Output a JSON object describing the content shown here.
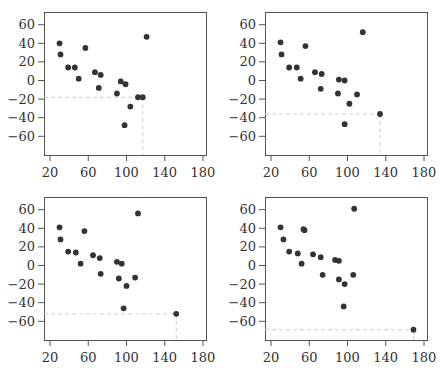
{
  "chart_data": [
    {
      "type": "scatter",
      "title": "",
      "xlabel": "",
      "ylabel": "",
      "xlim": [
        15,
        185
      ],
      "ylim": [
        -82,
        72
      ],
      "xticks": [
        20,
        60,
        100,
        140,
        180
      ],
      "yticks": [
        60,
        40,
        20,
        0,
        -20,
        -40,
        -60
      ],
      "xtick_labels": [
        "20",
        "60",
        "100",
        "140",
        "180"
      ],
      "ytick_labels": [
        "60",
        "40",
        "20",
        "0",
        "−20",
        "−40",
        "−60"
      ],
      "grid": false,
      "point_color": "#333333",
      "guide_color": "#cccccc",
      "highlight_point": {
        "x": 117,
        "y": -18
      },
      "points": [
        [
          30,
          40
        ],
        [
          31,
          28
        ],
        [
          39,
          14
        ],
        [
          46,
          14
        ],
        [
          50,
          2
        ],
        [
          57,
          35
        ],
        [
          67,
          9
        ],
        [
          73,
          6
        ],
        [
          71,
          -8
        ],
        [
          90,
          -14
        ],
        [
          94,
          -1
        ],
        [
          99,
          -4
        ],
        [
          98,
          -48
        ],
        [
          104,
          -28
        ],
        [
          112,
          -18
        ],
        [
          117,
          -18
        ],
        [
          121,
          47
        ]
      ]
    },
    {
      "type": "scatter",
      "title": "",
      "xlabel": "",
      "ylabel": "",
      "xlim": [
        15,
        185
      ],
      "ylim": [
        -82,
        72
      ],
      "xticks": [
        20,
        60,
        100,
        140,
        180
      ],
      "yticks": [
        60,
        40,
        20,
        0,
        -20,
        -40,
        -60
      ],
      "xtick_labels": [
        "20",
        "60",
        "100",
        "140",
        "180"
      ],
      "ytick_labels": [
        "60",
        "40",
        "20",
        "0",
        "−20",
        "−40",
        "−60"
      ],
      "grid": false,
      "point_color": "#333333",
      "guide_color": "#cccccc",
      "highlight_point": {
        "x": 134,
        "y": -36
      },
      "points": [
        [
          30,
          41
        ],
        [
          31,
          28
        ],
        [
          39,
          14
        ],
        [
          47,
          14
        ],
        [
          51,
          2
        ],
        [
          56,
          37
        ],
        [
          66,
          9
        ],
        [
          73,
          7
        ],
        [
          72,
          -9
        ],
        [
          91,
          1
        ],
        [
          97,
          0
        ],
        [
          90,
          -14
        ],
        [
          102,
          -25
        ],
        [
          110,
          -15
        ],
        [
          97,
          -47
        ],
        [
          116,
          52
        ],
        [
          134,
          -36
        ]
      ]
    },
    {
      "type": "scatter",
      "title": "",
      "xlabel": "",
      "ylabel": "",
      "xlim": [
        15,
        185
      ],
      "ylim": [
        -82,
        72
      ],
      "xticks": [
        20,
        60,
        100,
        140,
        180
      ],
      "yticks": [
        60,
        40,
        20,
        0,
        -20,
        -40,
        -60
      ],
      "xtick_labels": [
        "20",
        "60",
        "100",
        "140",
        "180"
      ],
      "ytick_labels": [
        "60",
        "40",
        "20",
        "0",
        "−20",
        "−40",
        "−60"
      ],
      "grid": false,
      "point_color": "#333333",
      "guide_color": "#cccccc",
      "highlight_point": {
        "x": 152,
        "y": -52
      },
      "points": [
        [
          30,
          41
        ],
        [
          31,
          28
        ],
        [
          39,
          15
        ],
        [
          47,
          14
        ],
        [
          52,
          2
        ],
        [
          56,
          37
        ],
        [
          65,
          11
        ],
        [
          72,
          8
        ],
        [
          73,
          -9
        ],
        [
          90,
          4
        ],
        [
          95,
          2
        ],
        [
          92,
          -14
        ],
        [
          100,
          -22
        ],
        [
          109,
          -13
        ],
        [
          97,
          -46
        ],
        [
          112,
          56
        ],
        [
          152,
          -52
        ]
      ]
    },
    {
      "type": "scatter",
      "title": "",
      "xlabel": "",
      "ylabel": "",
      "xlim": [
        15,
        185
      ],
      "ylim": [
        -82,
        72
      ],
      "xticks": [
        20,
        60,
        100,
        140,
        180
      ],
      "yticks": [
        60,
        40,
        20,
        0,
        -20,
        -40,
        -60
      ],
      "xtick_labels": [
        "20",
        "60",
        "100",
        "140",
        "180"
      ],
      "ytick_labels": [
        "60",
        "40",
        "20",
        "0",
        "−20",
        "−40",
        "−60"
      ],
      "grid": false,
      "point_color": "#333333",
      "guide_color": "#cccccc",
      "highlight_point": {
        "x": 169,
        "y": -69
      },
      "points": [
        [
          30,
          41
        ],
        [
          33,
          28
        ],
        [
          39,
          15
        ],
        [
          48,
          13
        ],
        [
          52,
          2
        ],
        [
          54,
          39
        ],
        [
          55,
          38
        ],
        [
          64,
          12
        ],
        [
          72,
          9
        ],
        [
          74,
          -10
        ],
        [
          87,
          6
        ],
        [
          91,
          5
        ],
        [
          91,
          -15
        ],
        [
          97,
          -20
        ],
        [
          106,
          -10
        ],
        [
          96,
          -44
        ],
        [
          107,
          61
        ],
        [
          169,
          -69
        ]
      ]
    }
  ],
  "layout": {
    "panels": [
      {
        "left": 0,
        "top": 0
      },
      {
        "left": 221,
        "top": 0
      },
      {
        "left": 0,
        "top": 185
      },
      {
        "left": 221,
        "top": 185
      }
    ]
  }
}
